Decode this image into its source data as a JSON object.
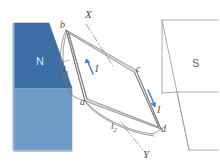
{
  "figure": {
    "type": "physics-diagram",
    "colors": {
      "magnet_dark_blue": "#3a6ea5",
      "magnet_light_blue": "#6f9cc7",
      "coil_line": "#6b6b6b",
      "current_arrow": "#4d7fc4",
      "label_gray": "#4a4a4a",
      "background": "#ffffff"
    },
    "magnets": [
      {
        "name": "north-pole-magnet",
        "pole_label": "N",
        "side": "left",
        "fill_top": "#3a6ea5",
        "fill_bottom": "#6f9cc7"
      },
      {
        "name": "south-pole-magnet",
        "pole_label": "S",
        "side": "right",
        "fill": "#ffffff",
        "outline": "#9a9a9a"
      }
    ],
    "coil": {
      "name": "rectangular-coil-abcd",
      "vertices": [
        {
          "id": "b",
          "label": "b",
          "x": 66,
          "y": 30
        },
        {
          "id": "c",
          "label": "c",
          "x": 136,
          "y": 71
        },
        {
          "id": "d",
          "label": "d",
          "x": 161,
          "y": 129
        },
        {
          "id": "a",
          "label": "a",
          "x": 85,
          "y": 101
        }
      ],
      "side_labels": [
        {
          "id": "l1",
          "label": "l",
          "sub": "1",
          "x": 65,
          "y": 67
        },
        {
          "id": "l2",
          "label": "l",
          "sub": "2",
          "x": 113,
          "y": 124
        }
      ]
    },
    "axis": {
      "name": "rotation-axis-XY",
      "top_label": "X",
      "bottom_label": "Y",
      "style": "dash-dot"
    },
    "current_arrows": [
      {
        "id": "I-left",
        "label": "I",
        "direction": "down-right"
      },
      {
        "id": "I-right",
        "label": "I",
        "direction": "down-right"
      }
    ]
  }
}
